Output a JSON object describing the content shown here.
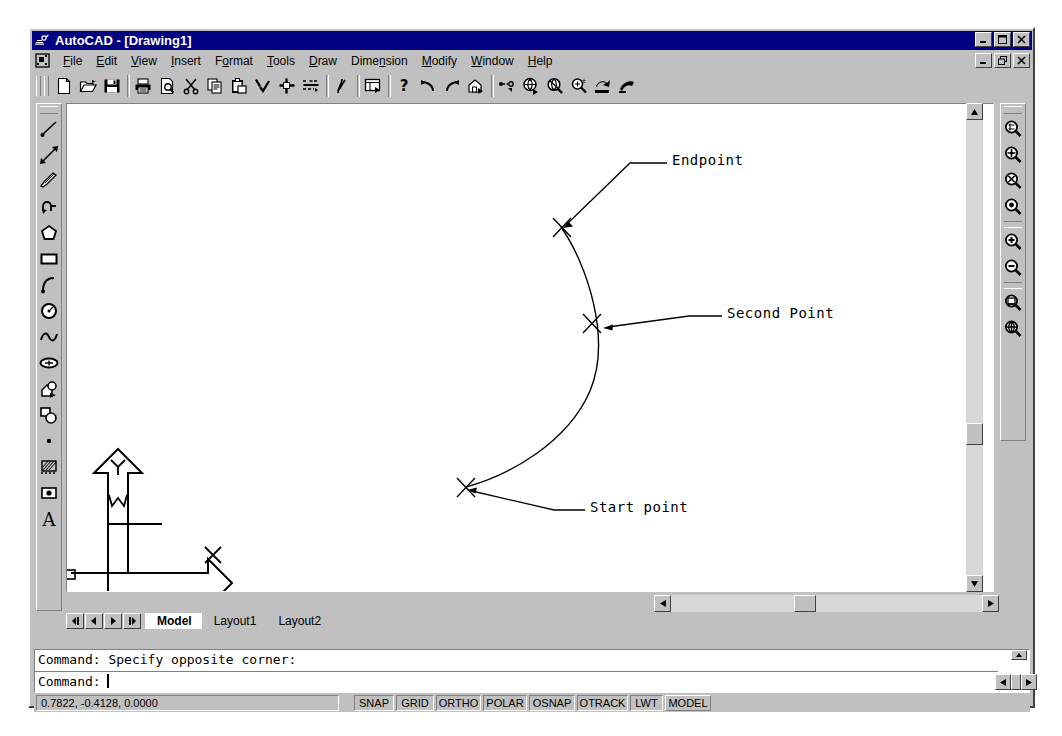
{
  "window": {
    "app_icon": "autocad-logo-icon",
    "title": "AutoCAD - [Drawing1]",
    "controls": [
      {
        "name": "minimize",
        "glyph": "_"
      },
      {
        "name": "maximize",
        "glyph": "□"
      },
      {
        "name": "close",
        "glyph": "×"
      }
    ],
    "mdi_controls": [
      {
        "name": "mdi-minimize",
        "glyph": "_"
      },
      {
        "name": "mdi-restore",
        "glyph": "❐"
      },
      {
        "name": "mdi-close",
        "glyph": "×"
      }
    ]
  },
  "menubar": {
    "doc_icon": "document-control-icon",
    "items": [
      {
        "label": "File",
        "mnemonic": "F"
      },
      {
        "label": "Edit",
        "mnemonic": "E"
      },
      {
        "label": "View",
        "mnemonic": "V"
      },
      {
        "label": "Insert",
        "mnemonic": "I"
      },
      {
        "label": "Format",
        "mnemonic": "o"
      },
      {
        "label": "Tools",
        "mnemonic": "T"
      },
      {
        "label": "Draw",
        "mnemonic": "D"
      },
      {
        "label": "Dimension",
        "mnemonic": "n"
      },
      {
        "label": "Modify",
        "mnemonic": "M"
      },
      {
        "label": "Window",
        "mnemonic": "W"
      },
      {
        "label": "Help",
        "mnemonic": "H"
      }
    ]
  },
  "toolbar": {
    "name": "Standard Toolbar",
    "buttons": [
      {
        "icon": "new-file-icon",
        "label": "QNew"
      },
      {
        "icon": "open-folder-icon",
        "label": "Open"
      },
      {
        "icon": "save-disk-icon",
        "label": "Save"
      },
      {
        "icon": "printer-icon",
        "label": "Plot"
      },
      {
        "icon": "print-preview-icon",
        "label": "Plot Preview"
      },
      {
        "icon": "scissors-cut-icon",
        "label": "Cut"
      },
      {
        "icon": "copy-icon",
        "label": "Copy"
      },
      {
        "icon": "paste-icon",
        "label": "Paste"
      },
      {
        "icon": "match-properties-icon",
        "label": "Match Properties"
      },
      {
        "icon": "properties-icon",
        "label": "Properties"
      },
      {
        "icon": "sheet-set-icon",
        "label": "Sheet Set Manager"
      },
      {
        "icon": "pen-draworder-icon",
        "label": "Draw Order"
      },
      {
        "icon": "blocks-palette-icon",
        "label": "DesignCenter"
      },
      {
        "icon": "help-question-icon",
        "label": "Help"
      },
      {
        "icon": "undo-arrow-icon",
        "label": "Undo"
      },
      {
        "icon": "redo-arrow-icon",
        "label": "Redo"
      },
      {
        "icon": "insert-block-icon",
        "label": "Insert Block"
      },
      {
        "icon": "hyperlink-icon",
        "label": "Insert Hyperlink"
      },
      {
        "icon": "pan-realtime-icon",
        "label": "Pan Realtime"
      },
      {
        "icon": "zoom-realtime-icon",
        "label": "Zoom Realtime"
      },
      {
        "icon": "zoom-window-icon",
        "label": "Zoom Window"
      },
      {
        "icon": "zoom-previous-icon",
        "label": "Zoom Previous"
      },
      {
        "icon": "named-views-icon",
        "label": "Named Views"
      }
    ]
  },
  "draw_toolbar": {
    "name": "Draw Toolbar",
    "buttons": [
      {
        "icon": "line-icon",
        "label": "Line"
      },
      {
        "icon": "construction-line-icon",
        "label": "Construction Line"
      },
      {
        "icon": "polyline-icon",
        "label": "Polyline"
      },
      {
        "icon": "multiline-icon",
        "label": "Polyline"
      },
      {
        "icon": "polygon-icon",
        "label": "Polygon"
      },
      {
        "icon": "rectangle-icon",
        "label": "Rectangle"
      },
      {
        "icon": "arc-icon",
        "label": "Arc"
      },
      {
        "icon": "circle-icon",
        "label": "Circle"
      },
      {
        "icon": "spline-icon",
        "label": "Spline"
      },
      {
        "icon": "ellipse-icon",
        "label": "Ellipse"
      },
      {
        "icon": "insert-block-icon",
        "label": "Insert Block"
      },
      {
        "icon": "make-block-icon",
        "label": "Make Block"
      },
      {
        "icon": "point-icon",
        "label": "Point"
      },
      {
        "icon": "hatch-icon",
        "label": "Hatch"
      },
      {
        "icon": "region-icon",
        "label": "Region"
      },
      {
        "icon": "multiline-text-icon",
        "label": "Multiline Text"
      }
    ]
  },
  "zoom_toolbar": {
    "name": "Zoom Toolbar",
    "buttons": [
      {
        "icon": "zoom-window-icon",
        "label": "Zoom Window"
      },
      {
        "icon": "zoom-dynamic-icon",
        "label": "Zoom Dynamic"
      },
      {
        "icon": "zoom-scale-icon",
        "label": "Zoom Scale"
      },
      {
        "icon": "zoom-center-icon",
        "label": "Zoom Center"
      },
      {
        "icon": "zoom-in-icon",
        "label": "Zoom In"
      },
      {
        "icon": "zoom-out-icon",
        "label": "Zoom Out"
      },
      {
        "icon": "zoom-all-icon",
        "label": "Zoom All"
      },
      {
        "icon": "zoom-extents-icon",
        "label": "Zoom Extents"
      }
    ]
  },
  "drawing": {
    "ucs_icon": {
      "x_label": "X",
      "y_label": "Y",
      "w_label": "W"
    },
    "annotations": [
      {
        "name": "endpoint-label",
        "text": "Endpoint",
        "x": 636,
        "y": 132
      },
      {
        "name": "second-point-label",
        "text": "Second Point",
        "x": 690,
        "y": 288
      },
      {
        "name": "start-point-label",
        "text": "Start point",
        "x": 553,
        "y": 479
      }
    ],
    "markers": [
      {
        "name": "endpoint-marker",
        "x": 527,
        "y": 197
      },
      {
        "name": "second-point-marker",
        "x": 558,
        "y": 293
      },
      {
        "name": "start-point-marker",
        "x": 432,
        "y": 457
      }
    ]
  },
  "tabs": {
    "nav": [
      {
        "name": "first-tab-button",
        "glyph": "◀│"
      },
      {
        "name": "prev-tab-button",
        "glyph": "◀"
      },
      {
        "name": "next-tab-button",
        "glyph": "▶"
      },
      {
        "name": "last-tab-button",
        "glyph": "│▶"
      }
    ],
    "items": [
      {
        "label": "Model",
        "active": true
      },
      {
        "label": "Layout1",
        "active": false
      },
      {
        "label": "Layout2",
        "active": false
      }
    ]
  },
  "command_window": {
    "history": "Command: Specify opposite corner:",
    "prompt": "Command:",
    "input_value": ""
  },
  "statusbar": {
    "coordinates": "0.7822, -0.4128, 0.0000",
    "toggles": [
      {
        "label": "SNAP",
        "active": false
      },
      {
        "label": "GRID",
        "active": false
      },
      {
        "label": "ORTHO",
        "active": false
      },
      {
        "label": "POLAR",
        "active": false
      },
      {
        "label": "OSNAP",
        "active": false
      },
      {
        "label": "OTRACK",
        "active": false
      },
      {
        "label": "LWT",
        "active": false
      },
      {
        "label": "MODEL",
        "active": true
      }
    ]
  },
  "colors": {
    "titlebar": "#000080",
    "face": "#c0c0c0",
    "canvas": "#ffffff",
    "ink": "#000000"
  }
}
